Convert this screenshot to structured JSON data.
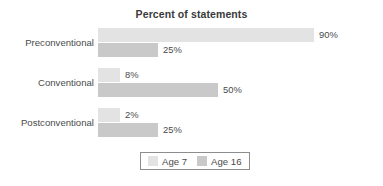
{
  "chart_data": {
    "type": "bar",
    "orientation": "horizontal",
    "title": "Percent of statements",
    "xlabel": "",
    "ylabel": "",
    "xlim": [
      0,
      100
    ],
    "grid": false,
    "legend_position": "bottom-center",
    "categories": [
      "Preconventional",
      "Conventional",
      "Postconventional"
    ],
    "series": [
      {
        "name": "Age 7",
        "color": "#e3e3e3",
        "values": [
          90,
          8,
          2
        ],
        "labels": [
          "90%",
          "8%",
          "2%"
        ]
      },
      {
        "name": "Age 16",
        "color": "#c9c9c9",
        "values": [
          25,
          50,
          25
        ],
        "labels": [
          "25%",
          "50%",
          "25%"
        ]
      }
    ]
  },
  "legend": {
    "items": [
      {
        "label": "Age 7",
        "color": "#e3e3e3"
      },
      {
        "label": "Age 16",
        "color": "#c9c9c9"
      }
    ]
  },
  "colors": {
    "age7": "#e3e3e3",
    "age16": "#c9c9c9",
    "text": "#4b4b4b",
    "title": "#3a3a3a",
    "legend_border": "#8d8d8d",
    "background": "#ffffff"
  }
}
